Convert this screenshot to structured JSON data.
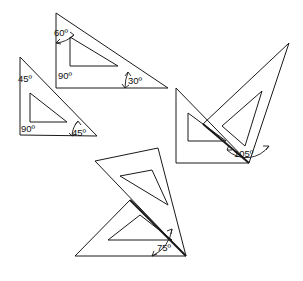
{
  "figure": {
    "background_color": "#ffffff",
    "line_color": "#1a1a1a"
  },
  "labels": {
    "deg60": "60º",
    "deg90_top": "90º",
    "deg30": "30º",
    "deg45_top": "45º",
    "deg90_left": "90º",
    "deg45_bottom": "45º",
    "deg105": "105º",
    "deg75": "75º"
  },
  "shapes": {
    "top_set_square": {
      "name": "30-60-90 set square",
      "angles": [
        "60º",
        "90º",
        "30º"
      ],
      "outer_points": "56,13 56,88 168,88",
      "inner_points": "70,37 70,66 118,66"
    },
    "left_set_square": {
      "name": "45-45-90 set square",
      "angles": [
        "45º",
        "90º",
        "45º"
      ],
      "outer_points": "20,57 20,135 97,136",
      "inner_points": "30,93 30,122 67,122"
    },
    "right_pair_square": {
      "name": "45-45-90 set square (right group)",
      "angles": [
        "45º",
        "90º",
        "45º"
      ],
      "outer_points": "176,88 176,163 249,163",
      "inner_points": "188,113 188,141 226,141"
    },
    "right_pair_slanted": {
      "name": "30-60-90 set square rotated (right group)",
      "angles": [
        "30º",
        "60º",
        "90º"
      ],
      "outer_points": "289,43 249,163 203,124",
      "inner_points": "262,91 245,146 222,126"
    },
    "bottom_pair_square": {
      "name": "45-45-90 set square (bottom group)",
      "angles": [
        "45º",
        "90º",
        "45º"
      ],
      "outer_points": "75,256 186,256 130,200",
      "inner_points": "108,240 172,240 140,215"
    },
    "bottom_pair_slanted": {
      "name": "30-60-90 set square rotated (bottom group)",
      "angles": [
        "30º",
        "60º",
        "90º"
      ],
      "outer_points": "95,161 158,148 186,256",
      "inner_points": "120,176 152,170 168,205"
    }
  },
  "annotations": [
    {
      "id": "a60",
      "value": "60º",
      "x": 54,
      "y": 36
    },
    {
      "id": "a90t",
      "value": "90º",
      "x": 58,
      "y": 79
    },
    {
      "id": "a30",
      "value": "30º",
      "x": 128,
      "y": 84
    },
    {
      "id": "a45t",
      "value": "45º",
      "x": 18,
      "y": 82
    },
    {
      "id": "a90l",
      "value": "90º",
      "x": 21,
      "y": 132
    },
    {
      "id": "a45b",
      "value": "45º",
      "x": 72,
      "y": 136
    },
    {
      "id": "a105",
      "value": "105º",
      "x": 234,
      "y": 157
    },
    {
      "id": "a75",
      "value": "75º",
      "x": 157,
      "y": 251
    }
  ]
}
